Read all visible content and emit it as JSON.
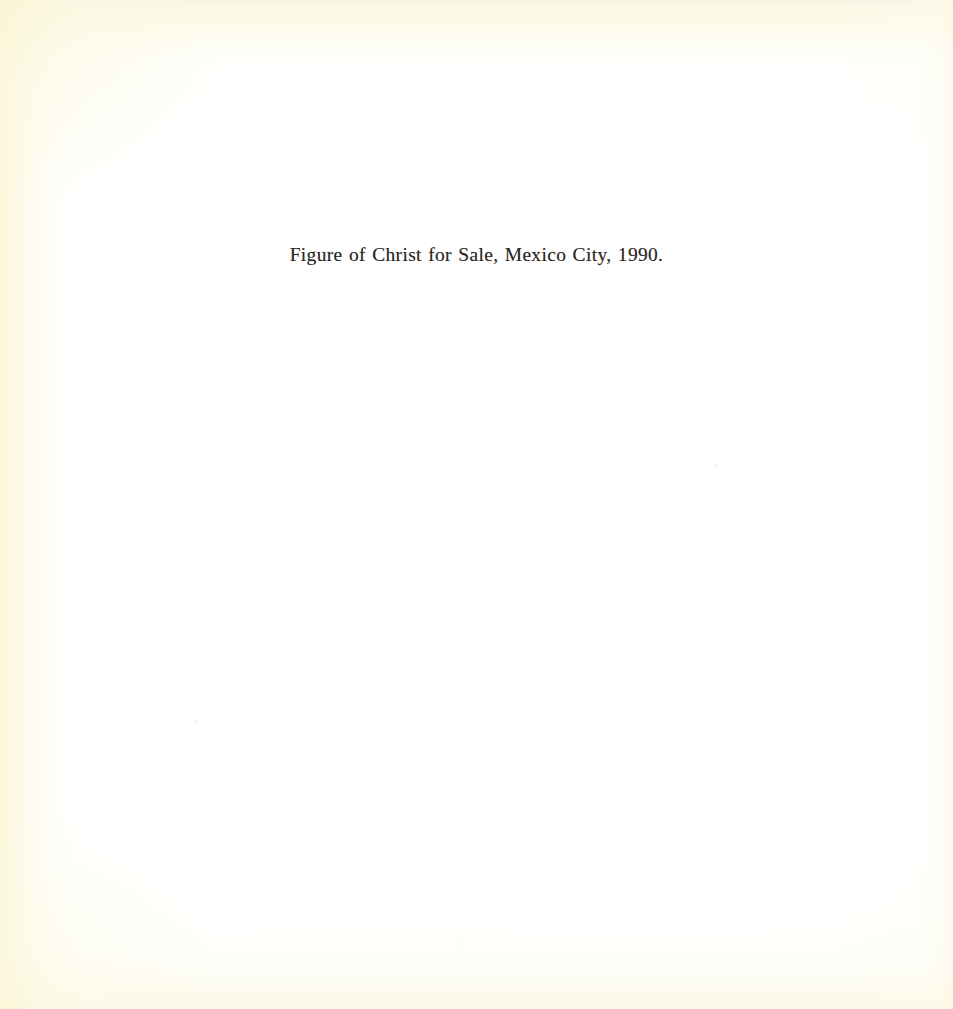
{
  "document": {
    "kind": "scanned-book-page",
    "page_width": 953,
    "page_height": 1009,
    "caption": "Figure of Christ for Sale, Mexico City, 1990."
  },
  "caption": {
    "text": "Figure of Christ for Sale, Mexico City, 1990.",
    "subject": "Figure of Christ for Sale",
    "place": "Mexico City",
    "year": "1990",
    "alignment": "center"
  },
  "colors": {
    "paper_white": "#FFFFFE",
    "vignette_cream": "#FCF8DE",
    "vignette_cream_light": "#FDFAE6",
    "vignette_top_band": "#F6F3E2",
    "text_ink": "#2B2622",
    "speck_gray": "#D8D6D2"
  },
  "artifacts": {
    "specks": [
      {
        "x": 715,
        "y": 465,
        "size": 3.0,
        "opacity": 0.3
      },
      {
        "x": 196,
        "y": 722,
        "size": 3.2,
        "opacity": 0.26
      },
      {
        "x": 424,
        "y": 108,
        "size": 2.4,
        "opacity": 0.18
      },
      {
        "x": 231,
        "y": 133,
        "size": 2.2,
        "opacity": 0.16
      },
      {
        "x": 456,
        "y": 176,
        "size": 2.2,
        "opacity": 0.15
      },
      {
        "x": 697,
        "y": 75,
        "size": 2.0,
        "opacity": 0.14
      },
      {
        "x": 793,
        "y": 377,
        "size": 2.2,
        "opacity": 0.15
      },
      {
        "x": 147,
        "y": 606,
        "size": 2.4,
        "opacity": 0.17
      },
      {
        "x": 447,
        "y": 592,
        "size": 2.2,
        "opacity": 0.14
      },
      {
        "x": 252,
        "y": 778,
        "size": 2.2,
        "opacity": 0.15
      },
      {
        "x": 372,
        "y": 858,
        "size": 2.0,
        "opacity": 0.13
      },
      {
        "x": 462,
        "y": 944,
        "size": 2.2,
        "opacity": 0.15
      },
      {
        "x": 108,
        "y": 284,
        "size": 2.0,
        "opacity": 0.13
      },
      {
        "x": 596,
        "y": 681,
        "size": 2.0,
        "opacity": 0.12
      }
    ]
  }
}
